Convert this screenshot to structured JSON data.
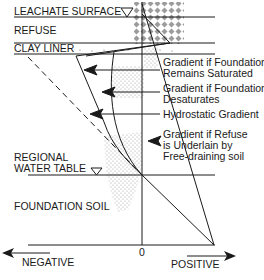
{
  "layers": {
    "leachate_surface": "LEACHATE SURFACE",
    "refuse": "REFUSE",
    "clay_liner": "CLAY LINER",
    "regional_water_table_line1": "REGIONAL",
    "regional_water_table_line2": "WATER TABLE",
    "foundation_soil": "FOUNDATION SOIL"
  },
  "gradients": {
    "remains_saturated_line1": "Gradient if Foundation",
    "remains_saturated_line2": "Remains Saturated",
    "desaturates_line1": "Gradient if Foundation",
    "desaturates_line2": "Desaturates",
    "hydrostatic": "Hydrostatic Gradient",
    "free_draining_line1": "Gradient if Refuse",
    "free_draining_line2": "is Underlain by",
    "free_draining_line3": "Free-draining soil"
  },
  "axis": {
    "zero": "0",
    "negative": "NEGATIVE",
    "positive": "POSITIVE"
  },
  "colors": {
    "line": "#1a1a1a",
    "stipple": "#9a9a9a",
    "refuse_pattern": "#8a8a8a",
    "background": "#ffffff"
  }
}
